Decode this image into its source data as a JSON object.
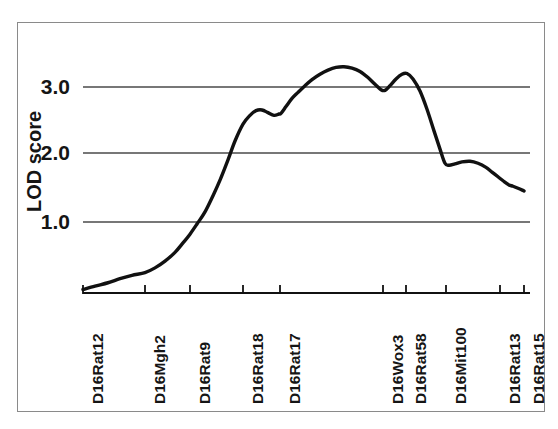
{
  "chart_data": {
    "type": "line",
    "title": "",
    "xlabel": "",
    "ylabel": "LOD score",
    "ylim": [
      0.0,
      3.55
    ],
    "yticks": [
      "1.0",
      "2.0",
      "3.0"
    ],
    "ytick_values": [
      1.0,
      2.0,
      3.0
    ],
    "grid": "horizontal",
    "legend": "none",
    "markers": [
      {
        "label": "D16Rat12",
        "x_px": 83
      },
      {
        "label": "D16Mgh2",
        "x_px": 145
      },
      {
        "label": "D16Rat9",
        "x_px": 190
      },
      {
        "label": "D16Rat18",
        "x_px": 243
      },
      {
        "label": "D16Rat17",
        "x_px": 280
      },
      {
        "label": "D16Wox3",
        "x_px": 383
      },
      {
        "label": "D16Rat58",
        "x_px": 406
      },
      {
        "label": "D16Mit100",
        "x_px": 446
      },
      {
        "label": "D16Rat13",
        "x_px": 500
      },
      {
        "label": "D16Rat15",
        "x_px": 524
      }
    ],
    "categories": [
      "D16Rat12",
      "D16Mgh2",
      "D16Rat9",
      "D16Rat18",
      "D16Rat17",
      "D16Wox3",
      "D16Rat58",
      "D16Mit100",
      "D16Rat13",
      "D16Rat15"
    ],
    "values_at_markers": [
      0.0,
      0.25,
      0.82,
      2.45,
      2.62,
      3.22,
      3.18,
      1.85,
      1.67,
      1.46
    ],
    "series": [
      {
        "name": "LOD score",
        "color": "#111111",
        "points": [
          [
            83,
            0.0
          ],
          [
            95,
            0.05
          ],
          [
            108,
            0.1
          ],
          [
            120,
            0.16
          ],
          [
            132,
            0.21
          ],
          [
            145,
            0.25
          ],
          [
            155,
            0.32
          ],
          [
            165,
            0.42
          ],
          [
            175,
            0.55
          ],
          [
            183,
            0.69
          ],
          [
            190,
            0.82
          ],
          [
            197,
            0.97
          ],
          [
            205,
            1.15
          ],
          [
            213,
            1.39
          ],
          [
            220,
            1.62
          ],
          [
            228,
            1.92
          ],
          [
            235,
            2.2
          ],
          [
            243,
            2.45
          ],
          [
            250,
            2.58
          ],
          [
            256,
            2.65
          ],
          [
            262,
            2.66
          ],
          [
            268,
            2.62
          ],
          [
            274,
            2.58
          ],
          [
            279,
            2.6
          ],
          [
            281,
            2.61
          ],
          [
            286,
            2.71
          ],
          [
            292,
            2.83
          ],
          [
            298,
            2.92
          ],
          [
            305,
            3.02
          ],
          [
            312,
            3.11
          ],
          [
            320,
            3.19
          ],
          [
            328,
            3.25
          ],
          [
            336,
            3.29
          ],
          [
            344,
            3.3
          ],
          [
            352,
            3.28
          ],
          [
            360,
            3.23
          ],
          [
            368,
            3.14
          ],
          [
            375,
            3.04
          ],
          [
            381,
            2.96
          ],
          [
            385,
            2.95
          ],
          [
            390,
            3.02
          ],
          [
            396,
            3.12
          ],
          [
            402,
            3.19
          ],
          [
            407,
            3.2
          ],
          [
            413,
            3.12
          ],
          [
            420,
            2.94
          ],
          [
            427,
            2.67
          ],
          [
            434,
            2.35
          ],
          [
            440,
            2.08
          ],
          [
            445,
            1.87
          ],
          [
            449,
            1.84
          ],
          [
            455,
            1.86
          ],
          [
            462,
            1.89
          ],
          [
            470,
            1.9
          ],
          [
            478,
            1.87
          ],
          [
            486,
            1.81
          ],
          [
            492,
            1.74
          ],
          [
            498,
            1.67
          ],
          [
            504,
            1.6
          ],
          [
            509,
            1.55
          ],
          [
            513,
            1.53
          ],
          [
            518,
            1.5
          ],
          [
            524,
            1.46
          ]
        ]
      }
    ],
    "axis_baseline_px": 293,
    "y_px_per_unit": 67.5,
    "y_zero_px": 289.5,
    "gridline_px": {
      "3.0": 87,
      "2.0": 153,
      "1.0": 222
    },
    "plot_left_px": 83,
    "plot_right_px": 530
  },
  "axis": {
    "y_title": "LOD score",
    "y_labels": [
      "3.0",
      "2.0",
      "1.0"
    ]
  },
  "x_labels": [
    "D16Rat12",
    "D16Mgh2",
    "D16Rat9",
    "D16Rat18",
    "D16Rat17",
    "D16Wox3",
    "D16Rat58",
    "D16Mit100",
    "D16Rat13",
    "D16Rat15"
  ],
  "colors": {
    "curve": "#111111",
    "gridline": "#4a4a4a",
    "axis": "#111111",
    "frame": "#8a8a8a",
    "background": "#ffffff",
    "text": "#151515"
  },
  "artifact": {
    "bottom_text": ""
  }
}
